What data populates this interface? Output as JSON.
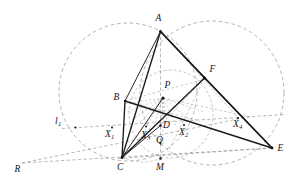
{
  "figure": {
    "kind": "euclidean-geometry-diagram",
    "width": 308,
    "height": 186,
    "background_color": "#ffffff",
    "solid_stroke_color": "#1b1b1b",
    "dashed_stroke_color": "#8c8c8c",
    "circle_stroke_color": "#949494"
  },
  "labels": {
    "A": "A",
    "B": "B",
    "C": "C",
    "D": "D",
    "E": "E",
    "F": "F",
    "M": "M",
    "P": "P",
    "Q": "Q",
    "R": "R",
    "l1_base": "l",
    "l1_sub": "1",
    "X1_base": "X",
    "X1_sub": "1",
    "X2_base": "X",
    "X2_sub": "2",
    "X3_base": "X",
    "X3_sub": "3",
    "X4_base": "X",
    "X4_sub": "4"
  },
  "points": {
    "A": {
      "x": 160.5,
      "y": 31.5,
      "label_x": 155.5,
      "label_y": 14.0
    },
    "B": {
      "x": 125.0,
      "y": 101.0,
      "label_x": 113.5,
      "label_y": 92.5
    },
    "C": {
      "x": 122.0,
      "y": 157.5,
      "label_x": 117.0,
      "label_y": 162.5
    },
    "D": {
      "x": 160.5,
      "y": 125.5,
      "label_x": 163.0,
      "label_y": 122.5
    },
    "E": {
      "x": 272.0,
      "y": 148.0,
      "label_x": 277.5,
      "label_y": 143.5
    },
    "F": {
      "x": 204.5,
      "y": 78.0,
      "label_x": 209.5,
      "label_y": 65.0
    },
    "M": {
      "x": 160.5,
      "y": 158.5,
      "label_x": 156.0,
      "label_y": 162.5
    },
    "P": {
      "x": 163.0,
      "y": 98.0,
      "label_x": 164.5,
      "label_y": 80.5
    },
    "Q": {
      "x": 160.5,
      "y": 143.0,
      "label_x": 156.0,
      "label_y": 138.5
    },
    "R": {
      "x": 22.0,
      "y": 163.0,
      "label_x": 14.5,
      "label_y": 167.0
    },
    "L1": {
      "x": 75.5,
      "y": 127.5,
      "label_x": 55.0,
      "label_y": 119.0
    },
    "X1": {
      "x": 112.0,
      "y": 127.5,
      "label_x": 106.0,
      "label_y": 130.5
    },
    "X2": {
      "x": 184.0,
      "y": 125.0,
      "label_x": 180.0,
      "label_y": 128.5
    },
    "X3": {
      "x": 146.0,
      "y": 126.5,
      "label_x": 142.0,
      "label_y": 131.5
    },
    "X4": {
      "x": 238.0,
      "y": 118.0,
      "label_x": 234.0,
      "label_y": 121.0
    }
  },
  "circles": [
    {
      "name": "circumcircle-left",
      "cx": 128.0,
      "cy": 92.0,
      "r": 69.0
    },
    {
      "name": "circumcircle-right",
      "cx": 212.0,
      "cy": 93.0,
      "r": 72.0
    },
    {
      "name": "small-circle-mid",
      "cx": 171.0,
      "cy": 115.0,
      "r": 43.0
    }
  ],
  "solid_segments": [
    {
      "name": "segment-A-C",
      "from": "A",
      "to": "C"
    },
    {
      "name": "segment-A-E",
      "from": "A",
      "to": "E"
    },
    {
      "name": "segment-C-E",
      "from": "C",
      "to": "E"
    },
    {
      "name": "segment-A-F",
      "from": "A",
      "to": "F"
    },
    {
      "name": "segment-F-E",
      "from": "F",
      "to": "E"
    },
    {
      "name": "segment-F-C",
      "from": "F",
      "to": "C"
    },
    {
      "name": "segment-B-C",
      "from": "B",
      "to": "C"
    },
    {
      "name": "segment-B-E",
      "from": "B",
      "to": "E"
    },
    {
      "name": "segment-A-B",
      "from": "A",
      "to": "B"
    }
  ],
  "dashed_segments": [
    {
      "name": "line-l1-through-X1-X2",
      "from": "L1",
      "to": "X4"
    },
    {
      "name": "line-R-to-X4",
      "from": "R",
      "to": "X4"
    },
    {
      "name": "line-R-to-E",
      "from": "R",
      "to": "E"
    },
    {
      "name": "line-A-M-vertical",
      "from": "A",
      "to": "M"
    },
    {
      "name": "line-C-M-E",
      "from": "C",
      "to": "E"
    },
    {
      "name": "line-B-F",
      "from": "B",
      "to": "F"
    },
    {
      "name": "line-P-to-X4",
      "from": "P",
      "to": "X4"
    },
    {
      "name": "line-D-F",
      "from": "D",
      "to": "F"
    },
    {
      "name": "line-C-F",
      "from": "C",
      "to": "F"
    }
  ],
  "notes": {
    "description": "Triangle with cevians, two dashed circumcircles, transversal line l1 meeting points X1 X2 X3 X4, and a fan of dashed rays emanating from interior point P."
  }
}
